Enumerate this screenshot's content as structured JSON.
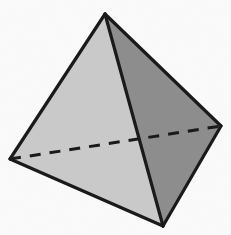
{
  "figure": {
    "name": "tetrahedron",
    "canvas": {
      "width": 231,
      "height": 235
    },
    "background_color": "#fbfbfb",
    "edge_color": "#1a1a1a",
    "edge_width": 3.2,
    "hidden_edge_color": "#1a1a1a",
    "hidden_edge_width": 3.0,
    "hidden_edge_dash": "11 9",
    "vertices": [
      {
        "id": "apex",
        "label": "top apex",
        "x": 105,
        "y": 14
      },
      {
        "id": "left",
        "label": "left base vertex",
        "x": 10,
        "y": 159
      },
      {
        "id": "right",
        "label": "right base vertex",
        "x": 221,
        "y": 126
      },
      {
        "id": "bottom-front",
        "label": "bottom front vertex",
        "x": 163,
        "y": 226
      }
    ],
    "faces": [
      {
        "id": "left-face",
        "label": "left visible face",
        "fill": "#cbcbcb",
        "points": "105,14 10,159 163,226"
      },
      {
        "id": "right-face",
        "label": "right visible face",
        "fill": "#8e8e8e",
        "points": "105,14 221,126 163,226"
      }
    ],
    "visible_edges": [
      {
        "id": "edge-apex-left",
        "label": "apex to left vertex",
        "x1": 105,
        "y1": 14,
        "x2": 10,
        "y2": 159
      },
      {
        "id": "edge-apex-right",
        "label": "apex to right vertex",
        "x1": 105,
        "y1": 14,
        "x2": 221,
        "y2": 126
      },
      {
        "id": "edge-apex-bottom",
        "label": "apex to bottom front vertex",
        "x1": 105,
        "y1": 14,
        "x2": 163,
        "y2": 226
      },
      {
        "id": "edge-left-bottom",
        "label": "left vertex to bottom front",
        "x1": 10,
        "y1": 159,
        "x2": 163,
        "y2": 226
      },
      {
        "id": "edge-right-bottom",
        "label": "right vertex to bottom front",
        "x1": 221,
        "y1": 126,
        "x2": 163,
        "y2": 226
      }
    ],
    "hidden_edges": [
      {
        "id": "edge-left-right-hidden",
        "label": "hidden back edge left to right",
        "x1": 10,
        "y1": 159,
        "x2": 221,
        "y2": 126
      }
    ],
    "counts": {
      "vertices": 4,
      "edges": 6,
      "faces": 4,
      "visible_edges": 5,
      "hidden_edges": 1
    }
  }
}
